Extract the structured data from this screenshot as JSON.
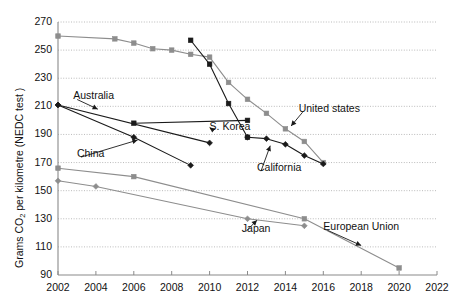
{
  "chart_data": {
    "type": "line",
    "title": "",
    "xlabel": "",
    "ylabel": "Grams CO2 per kilometre (NEDC test )",
    "ylabel_parts": {
      "pre": "Grams CO",
      "sub": "2",
      "post": " per kilometre (NEDC test )"
    },
    "xlim": [
      2002,
      2022
    ],
    "ylim": [
      90,
      270
    ],
    "ytick_step": 20,
    "xtick_step": 2,
    "grid": true,
    "grid_style": "dotted-horizontal",
    "legend": "inline-annotations",
    "x_ticks": [
      "2002",
      "2004",
      "2006",
      "2008",
      "2010",
      "2012",
      "2014",
      "2016",
      "2018",
      "2020",
      "2022"
    ],
    "y_ticks": [
      "90",
      "110",
      "130",
      "150",
      "170",
      "190",
      "210",
      "230",
      "250",
      "270"
    ],
    "series": [
      {
        "name": "United states",
        "color": "#8d8d8d",
        "marker": "square",
        "points": [
          {
            "x": 2002,
            "y": 260
          },
          {
            "x": 2005,
            "y": 258
          },
          {
            "x": 2006,
            "y": 255
          },
          {
            "x": 2007,
            "y": 251
          },
          {
            "x": 2008,
            "y": 250
          },
          {
            "x": 2009,
            "y": 247
          },
          {
            "x": 2010,
            "y": 245
          },
          {
            "x": 2011,
            "y": 227
          },
          {
            "x": 2012,
            "y": 215
          },
          {
            "x": 2013,
            "y": 205
          },
          {
            "x": 2014,
            "y": 194
          },
          {
            "x": 2015,
            "y": 185
          },
          {
            "x": 2016,
            "y": 170
          }
        ]
      },
      {
        "name": "S. Korea",
        "color": "#1a1a1a",
        "marker": "square",
        "points": [
          {
            "x": 2006,
            "y": 198
          },
          {
            "x": 2012,
            "y": 200
          }
        ]
      },
      {
        "name": "S. Korea-steep",
        "color": "#1a1a1a",
        "marker": "square",
        "points": [
          {
            "x": 2009,
            "y": 257
          },
          {
            "x": 2010,
            "y": 240
          },
          {
            "x": 2011,
            "y": 212
          },
          {
            "x": 2012,
            "y": 188
          }
        ]
      },
      {
        "name": "Australia",
        "color": "#1a1a1a",
        "marker": "diamond",
        "points": [
          {
            "x": 2002,
            "y": 211
          },
          {
            "x": 2006,
            "y": 188
          },
          {
            "x": 2009,
            "y": 168
          }
        ]
      },
      {
        "name": "China",
        "color": "#1a1a1a",
        "marker": "diamond",
        "points": [
          {
            "x": 2002,
            "y": 211
          },
          {
            "x": 2010,
            "y": 184
          }
        ]
      },
      {
        "name": "California",
        "color": "#1a1a1a",
        "marker": "diamond",
        "points": [
          {
            "x": 2012,
            "y": 188
          },
          {
            "x": 2013,
            "y": 187
          },
          {
            "x": 2014,
            "y": 183
          },
          {
            "x": 2015,
            "y": 175
          },
          {
            "x": 2016,
            "y": 169
          }
        ]
      },
      {
        "name": "European Union",
        "color": "#8d8d8d",
        "marker": "square",
        "points": [
          {
            "x": 2002,
            "y": 166
          },
          {
            "x": 2006,
            "y": 160
          },
          {
            "x": 2015,
            "y": 130
          },
          {
            "x": 2020,
            "y": 95
          }
        ]
      },
      {
        "name": "Japan",
        "color": "#8d8d8d",
        "marker": "diamond",
        "points": [
          {
            "x": 2002,
            "y": 157
          },
          {
            "x": 2004,
            "y": 153
          },
          {
            "x": 2012,
            "y": 130
          },
          {
            "x": 2015,
            "y": 125
          }
        ]
      }
    ],
    "annotations": [
      {
        "label": "Australia",
        "text_x": 2002.8,
        "text_y": 217,
        "arrow_to_x": 2004.1,
        "arrow_to_y": 208
      },
      {
        "label": "S. Korea",
        "text_x": 2010.0,
        "text_y": 195,
        "arrow_to_x": 2010.0,
        "arrow_to_y": 195
      },
      {
        "label": "China",
        "text_x": 2003.0,
        "text_y": 176,
        "arrow_to_x": 2006.2,
        "arrow_to_y": 186
      },
      {
        "label": "United states",
        "text_x": 2014.7,
        "text_y": 208,
        "arrow_to_x": 2014.3,
        "arrow_to_y": 196
      },
      {
        "label": "California",
        "text_x": 2012.5,
        "text_y": 166,
        "arrow_to_x": 2013.2,
        "arrow_to_y": 182
      },
      {
        "label": "Japan",
        "text_x": 2011.7,
        "text_y": 123,
        "arrow_to_x": 2012.5,
        "arrow_to_y": 129
      },
      {
        "label": "European Union",
        "text_x": 2016.0,
        "text_y": 124,
        "arrow_to_x": 2018.0,
        "arrow_to_y": 111
      }
    ]
  }
}
